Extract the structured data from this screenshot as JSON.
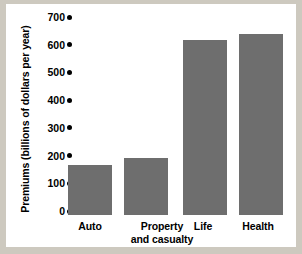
{
  "chart_data": {
    "type": "bar",
    "title": "",
    "xlabel": "",
    "ylabel": "Premiums (billions of dollars per year)",
    "categories": [
      "Auto",
      "Property and casualty",
      "Life",
      "Health"
    ],
    "values": [
      180,
      205,
      630,
      655
    ],
    "ylim": [
      0,
      700
    ],
    "yticks": [
      0,
      100,
      200,
      300,
      400,
      500,
      600,
      700
    ],
    "ytick_labels": [
      "0",
      "100",
      "200",
      "300",
      "400",
      "500",
      "600",
      "700"
    ],
    "grid": false,
    "legend": null,
    "series": [
      {
        "name": "Premiums",
        "values": [
          180,
          205,
          630,
          655
        ]
      }
    ],
    "colors": {
      "bar_fill": "#6e6e6e",
      "axis_text": "#000000",
      "plot_background": "#ffffff",
      "figure_background": "#cdc9bf"
    }
  },
  "axis": {
    "tick_marker_icon": "filled-dot-marker"
  },
  "categories_display": [
    {
      "line1": "Auto",
      "line2": ""
    },
    {
      "line1": "Property",
      "line2": "and casualty"
    },
    {
      "line1": "Life",
      "line2": ""
    },
    {
      "line1": "Health",
      "line2": ""
    }
  ]
}
